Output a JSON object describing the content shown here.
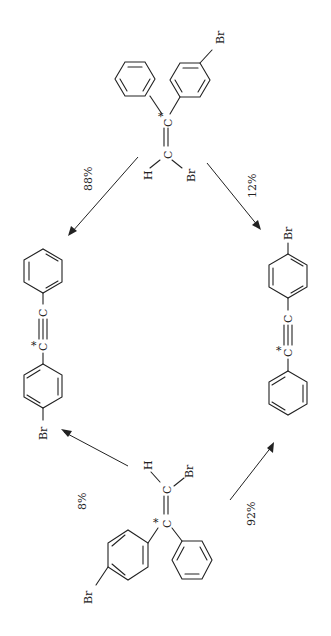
{
  "diagram": {
    "orientation": "rotated 90 degrees (text reads bottom-to-top)",
    "nodes": [
      {
        "id": "top-reactant",
        "label": "1-bromo-2-phenyl-2-(4-bromophenyl)ethene (*C labelled)",
        "atoms": [
          "*C",
          "C",
          "H",
          "Br",
          "Br"
        ]
      },
      {
        "id": "left-product",
        "label": "Ph-C≡*C-C6H4Br",
        "atoms": [
          "C",
          "*C",
          "Br"
        ]
      },
      {
        "id": "right-product",
        "label": "BrC6H4-C≡*C-Ph",
        "atoms": [
          "C",
          "*C",
          "Br"
        ]
      },
      {
        "id": "bottom-reactant",
        "label": "isomeric bromo vinyl compound (*C labelled)",
        "atoms": [
          "*C",
          "C",
          "H",
          "Br",
          "Br"
        ]
      }
    ],
    "edges": [
      {
        "from": "top-reactant",
        "to": "left-product",
        "label": "88%"
      },
      {
        "from": "top-reactant",
        "to": "right-product",
        "label": "12%"
      },
      {
        "from": "bottom-reactant",
        "to": "left-product",
        "label": "8%"
      },
      {
        "from": "bottom-reactant",
        "to": "right-product",
        "label": "92%"
      }
    ]
  },
  "labels": {
    "star_c": "*C",
    "c": "C",
    "h": "H",
    "br": "Br",
    "pct_88": "88%",
    "pct_12": "12%",
    "pct_8": "8%",
    "pct_92": "92%"
  }
}
